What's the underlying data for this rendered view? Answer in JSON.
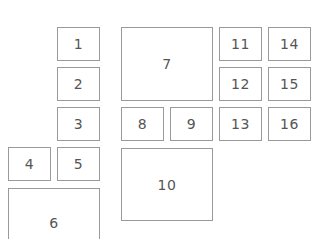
{
  "diagram": {
    "border_color": "#9a9a9a",
    "text_color": "#555555",
    "boxes": [
      {
        "label": "1",
        "x": 57,
        "y": 27,
        "w": 43,
        "h": 34
      },
      {
        "label": "2",
        "x": 57,
        "y": 67,
        "w": 43,
        "h": 34
      },
      {
        "label": "3",
        "x": 57,
        "y": 107,
        "w": 43,
        "h": 34
      },
      {
        "label": "4",
        "x": 8,
        "y": 147,
        "w": 43,
        "h": 34
      },
      {
        "label": "5",
        "x": 57,
        "y": 147,
        "w": 43,
        "h": 34
      },
      {
        "label": "6",
        "x": 8,
        "y": 188,
        "w": 92,
        "h": 60
      },
      {
        "label": "7",
        "x": 121,
        "y": 27,
        "w": 92,
        "h": 74
      },
      {
        "label": "8",
        "x": 121,
        "y": 107,
        "w": 43,
        "h": 34
      },
      {
        "label": "9",
        "x": 170,
        "y": 107,
        "w": 43,
        "h": 34
      },
      {
        "label": "10",
        "x": 121,
        "y": 148,
        "w": 92,
        "h": 73
      },
      {
        "label": "11",
        "x": 219,
        "y": 27,
        "w": 43,
        "h": 34
      },
      {
        "label": "12",
        "x": 219,
        "y": 67,
        "w": 43,
        "h": 34
      },
      {
        "label": "13",
        "x": 219,
        "y": 107,
        "w": 43,
        "h": 34
      },
      {
        "label": "14",
        "x": 268,
        "y": 27,
        "w": 43,
        "h": 34
      },
      {
        "label": "15",
        "x": 268,
        "y": 67,
        "w": 43,
        "h": 34
      },
      {
        "label": "16",
        "x": 268,
        "y": 107,
        "w": 43,
        "h": 34
      }
    ]
  }
}
